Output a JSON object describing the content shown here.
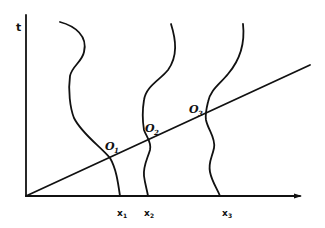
{
  "diagram": {
    "axes": {
      "y_label": "t",
      "x_label": ""
    },
    "curves": [
      {
        "id": "curve-1",
        "foot_label": "x",
        "foot_sub": "1",
        "intersection_label": "O",
        "intersection_sub": "1"
      },
      {
        "id": "curve-2",
        "foot_label": "x",
        "foot_sub": "2",
        "intersection_label": "O",
        "intersection_sub": "2"
      },
      {
        "id": "curve-3",
        "foot_label": "x",
        "foot_sub": "3",
        "intersection_label": "O",
        "intersection_sub": "3"
      }
    ],
    "colors": {
      "ink": "#111111",
      "background": "#ffffff"
    }
  }
}
